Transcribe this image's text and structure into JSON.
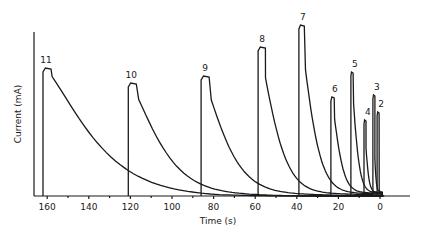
{
  "chart_data": {
    "type": "line",
    "title": "",
    "xlabel": "Time (s)",
    "ylabel": "Current (mA)",
    "x_reversed": true,
    "xlim": [
      166,
      -15
    ],
    "xticks": [
      160,
      140,
      120,
      100,
      80,
      60,
      40,
      20,
      0
    ],
    "minor_xtick_step": 10,
    "yticks": [],
    "grid": false,
    "legend": null,
    "baseline_y_px": 196,
    "px_per_second": 2.08,
    "zero_x_px": 380,
    "series": [
      {
        "name": "11",
        "start_time_s": 162.0,
        "peak_height_rel": 128,
        "decay_tau_s": 28
      },
      {
        "name": "10",
        "start_time_s": 121.0,
        "peak_height_rel": 113,
        "decay_tau_s": 18
      },
      {
        "name": "9",
        "start_time_s": 86.0,
        "peak_height_rel": 120,
        "decay_tau_s": 14
      },
      {
        "name": "8",
        "start_time_s": 58.6,
        "peak_height_rel": 149,
        "decay_tau_s": 10
      },
      {
        "name": "7",
        "start_time_s": 39.0,
        "peak_height_rel": 171,
        "decay_tau_s": 7.5
      },
      {
        "name": "6",
        "start_time_s": 23.6,
        "peak_height_rel": 99,
        "decay_tau_s": 4.5
      },
      {
        "name": "5",
        "start_time_s": 14.0,
        "peak_height_rel": 124,
        "decay_tau_s": 3.0
      },
      {
        "name": "4",
        "start_time_s": 7.7,
        "peak_height_rel": 76,
        "decay_tau_s": 1.6
      },
      {
        "name": "3",
        "start_time_s": 3.4,
        "peak_height_rel": 101,
        "decay_tau_s": 0.9
      },
      {
        "name": "2",
        "start_time_s": 1.4,
        "peak_height_rel": 84,
        "decay_tau_s": 0.4
      }
    ],
    "annotations": [
      "11",
      "10",
      "9",
      "8",
      "7",
      "6",
      "5",
      "4",
      "3",
      "2"
    ]
  }
}
